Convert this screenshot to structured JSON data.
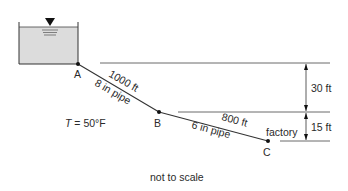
{
  "diagram": {
    "points": {
      "A": "A",
      "B": "B",
      "C": "C"
    },
    "pipe_ab": {
      "length": "1000 ft",
      "diameter": "8 in pipe"
    },
    "pipe_bc": {
      "length": "800 ft",
      "diameter": "6 in pipe"
    },
    "temperature": {
      "symbol": "T",
      "value": " = 50°F"
    },
    "factory_label": "factory",
    "elevation_1": "30 ft",
    "elevation_2": "15 ft",
    "note": "not to scale",
    "colors": {
      "line": "#333333",
      "water": "#d9d9d9"
    }
  }
}
